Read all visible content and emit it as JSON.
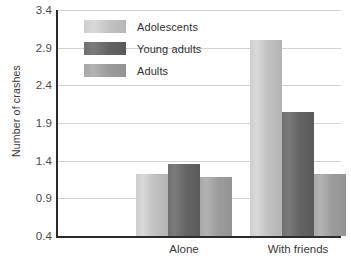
{
  "chart_data": {
    "type": "bar",
    "title": "",
    "subtitle": "",
    "xlabel": "",
    "ylabel": "Number of crashes",
    "categories": [
      "Alone",
      "With friends"
    ],
    "series": [
      {
        "name": "Adolescents",
        "values": [
          1.22,
          3.0
        ],
        "color": "#cfcfcf"
      },
      {
        "name": "Young adults",
        "values": [
          1.35,
          2.05
        ],
        "color": "#6f6f6f"
      },
      {
        "name": "Adults",
        "values": [
          1.19,
          1.22
        ],
        "color": "#a8a8a8"
      }
    ],
    "ylim": [
      0.4,
      3.4
    ],
    "yticks": [
      "0.4",
      "0.9",
      "1.4",
      "1.9",
      "2.4",
      "2.9",
      "3.4"
    ],
    "ytick_values": [
      0.4,
      0.9,
      1.4,
      1.9,
      2.4,
      2.9,
      3.4
    ],
    "grid": true,
    "legend_position": "inside-top-left",
    "orientation": "vertical",
    "grouping": "grouped"
  },
  "axis": {
    "y_title": "Number of crashes"
  },
  "legend": {
    "entries": [
      {
        "label": "Adolescents"
      },
      {
        "label": "Young adults"
      },
      {
        "label": "Adults"
      }
    ]
  },
  "colors": {
    "grid": "#d2d2d2",
    "axis": "#2b2b2b",
    "text": "#2f2f2f",
    "series_adolescents": "#cfcfcf",
    "series_young_adults": "#6f6f6f",
    "series_adults": "#a8a8a8"
  }
}
